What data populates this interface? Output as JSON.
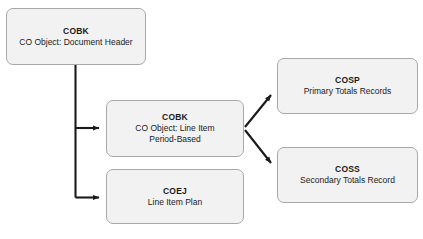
{
  "diagram": {
    "background_color": "#ffffff",
    "node_fill_color": "#f2f2f2",
    "node_border_color": "#a8a8a8",
    "connector_color": "#1a1a1a",
    "nodes": [
      {
        "id": "cobk-header",
        "title": "COBK",
        "subtitle": "CO Object: Document Header"
      },
      {
        "id": "cobk-line",
        "title": "COBK",
        "subtitle": "CO Object: Line Item\nPeriod-Based"
      },
      {
        "id": "coej",
        "title": "COEJ",
        "subtitle": "Line Item Plan"
      },
      {
        "id": "cosp",
        "title": "COSP",
        "subtitle": "Primary Totals Records"
      },
      {
        "id": "coss",
        "title": "COSS",
        "subtitle": "Secondary Totals Record"
      }
    ],
    "edges": [
      {
        "id": "header-to-line",
        "from": "cobk-header",
        "to": "cobk-line",
        "style": "elbow",
        "arrow": "end"
      },
      {
        "id": "header-to-coej",
        "from": "cobk-header",
        "to": "coej",
        "style": "elbow",
        "arrow": "end"
      },
      {
        "id": "line-to-cosp",
        "from": "cobk-line",
        "to": "cosp",
        "style": "diagonal",
        "arrow": "end"
      },
      {
        "id": "line-to-coss",
        "from": "cobk-line",
        "to": "coss",
        "style": "diagonal",
        "arrow": "end"
      }
    ]
  }
}
